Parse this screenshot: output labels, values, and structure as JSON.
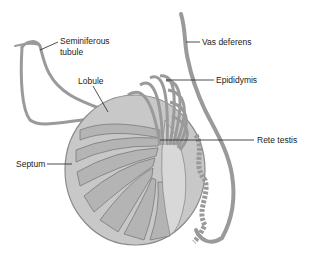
{
  "diagram": {
    "labels": {
      "seminiferous_tubule_line1": "Seminiferous",
      "seminiferous_tubule_line2": "tubule",
      "lobule": "Lobule",
      "septum": "Septum",
      "vas_deferens": "Vas deferens",
      "epididymis": "Epididymis",
      "rete_testis": "Rete testis"
    },
    "colors": {
      "tissue_fill": "#c8c8c8",
      "tubule": "#9a9a9a",
      "outline": "#7a7a7a",
      "leader_line": "#222222",
      "background": "#ffffff"
    }
  }
}
